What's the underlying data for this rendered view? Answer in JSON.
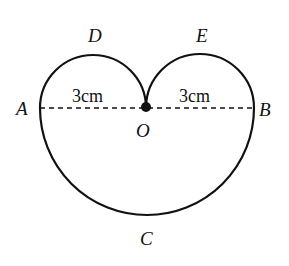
{
  "figure": {
    "points": {
      "A": "A",
      "B": "B",
      "O": "O",
      "C": "C",
      "D": "D",
      "E": "E"
    },
    "measurements": {
      "AO": "3cm",
      "OB": "3cm"
    },
    "colors": {
      "stroke": "#111111",
      "background": "#ffffff"
    }
  }
}
